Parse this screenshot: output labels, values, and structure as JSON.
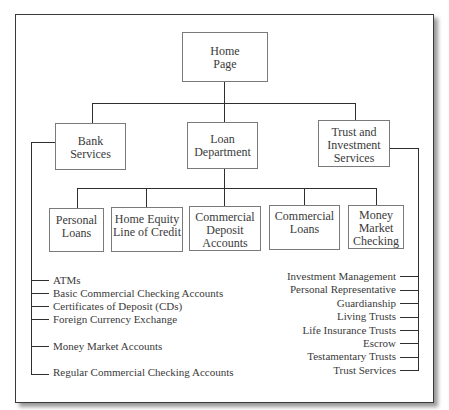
{
  "diagram": {
    "type": "site-map hierarchy",
    "root": {
      "label": "Home\nPage"
    },
    "level2": [
      {
        "id": "bank",
        "label": "Bank\nServices"
      },
      {
        "id": "loan",
        "label": "Loan\nDepartment"
      },
      {
        "id": "trust",
        "label": "Trust and\nInvestment\nServices"
      }
    ],
    "loan_children": [
      {
        "label": "Personal\nLoans"
      },
      {
        "label": "Home Equity\nLine of Credit"
      },
      {
        "label": "Commercial\nDeposit\nAccounts"
      },
      {
        "label": "Commercial\nLoans"
      },
      {
        "label": "Money\nMarket\nChecking"
      }
    ],
    "bank_children": [
      "ATMs",
      "Basic Commercial Checking Accounts",
      "Certificates of Deposit (CDs)",
      "Foreign Currency Exchange",
      "Money Market Accounts",
      "Regular Commercial Checking Accounts"
    ],
    "trust_children": [
      "Investment Management",
      "Personal Representative",
      "Guardianship",
      "Living Trusts",
      "Life Insurance Trusts",
      "Escrow",
      "Testamentary Trusts",
      "Trust Services"
    ]
  }
}
